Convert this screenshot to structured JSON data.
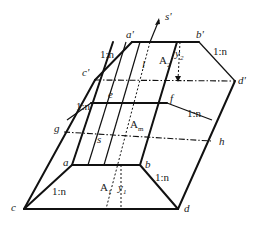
{
  "figure": {
    "type": "isometric trapezoidal channel / prism section diagram",
    "vertices": {
      "a_prime": "a'",
      "b_prime": "b'",
      "c_prime": "c'",
      "d_prime": "d'",
      "s_prime": "s'",
      "e": "e",
      "f": "f",
      "g": "g",
      "h": "h",
      "s": "s",
      "a": "a",
      "b": "b",
      "c": "c",
      "d": "d"
    },
    "slope_labels": {
      "top_left": "1:n",
      "top_right": "1:n",
      "mid_left": "1:n",
      "mid_right": "1:n",
      "bottom_left": "1:n",
      "bottom_right": "1:n"
    },
    "area_labels": {
      "A2": "A",
      "A2_sub": "2",
      "Am": "A",
      "Am_sub": "m",
      "A1": "A",
      "A1_sub": "1"
    },
    "depth_labels": {
      "y2": "y",
      "y2_sub": "2",
      "y1": "y",
      "y1_sub": "1"
    },
    "length_label": "l"
  }
}
